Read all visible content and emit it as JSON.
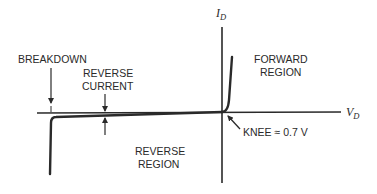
{
  "diagram": {
    "axes": {
      "y": {
        "symbol": "I",
        "subscript": "D"
      },
      "x": {
        "symbol": "V",
        "subscript": "D"
      }
    },
    "labels": {
      "breakdown": "BREAKDOWN",
      "reverse_current_line1": "REVERSE",
      "reverse_current_line2": "CURRENT",
      "forward_region_line1": "FORWARD",
      "forward_region_line2": "REGION",
      "reverse_region_line1": "REVERSE",
      "reverse_region_line2": "REGION",
      "knee": "KNEE ≈ 0.7 V"
    },
    "colors": {
      "line": "#2a2a2a",
      "background": "#ffffff"
    }
  }
}
